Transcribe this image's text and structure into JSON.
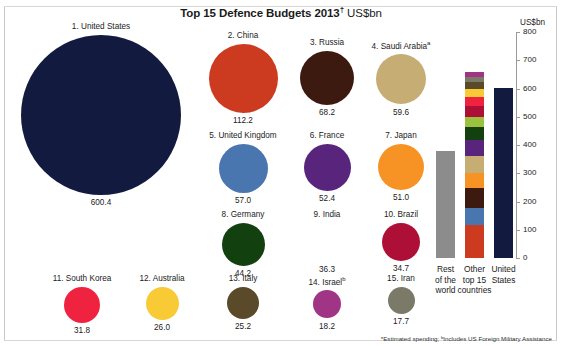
{
  "title": {
    "main": "Top 15 Defence Budgets 2013",
    "dagger": "†",
    "unit": "US$bn"
  },
  "axis": {
    "unit_label": "US$bn",
    "ticks": [
      "800",
      "700",
      "600",
      "500",
      "400",
      "300",
      "200",
      "100",
      "0"
    ]
  },
  "footnote": {
    "text": "*Estimated spending; ᵇIncludes US Foreign Military Assistance"
  },
  "bars": [
    {
      "key": "rest-of-world",
      "caption_lines": [
        "Rest",
        "of the",
        "world"
      ],
      "value": 380,
      "color": "#8c8c8c"
    },
    {
      "key": "other-top-15",
      "caption_lines": [
        "Other",
        "top 15",
        "countries"
      ],
      "value": 660,
      "color": "#d94d2a"
    },
    {
      "key": "united-states",
      "caption_lines": [
        "United",
        "States"
      ],
      "value": 600.4,
      "color": "#131a3f"
    }
  ],
  "chart_data": {
    "type": "bar",
    "title": "Top 15 Defence Budgets 2013† US$bn",
    "xlabel": "",
    "ylabel": "US$bn",
    "ylim": [
      0,
      800
    ],
    "grid": false,
    "legend": "none",
    "bubbles": {
      "note": "Area-proportional circles, one per country; value in US$bn",
      "categories": [
        "United States",
        "China",
        "Russia",
        "Saudi Arabia",
        "United Kingdom",
        "France",
        "Japan",
        "Germany",
        "India",
        "Brazil",
        "South Korea",
        "Australia",
        "Italy",
        "Israel",
        "Iran"
      ],
      "values": [
        600.4,
        112.2,
        68.2,
        59.6,
        57.0,
        52.4,
        51.0,
        44.2,
        36.3,
        34.7,
        31.8,
        26.0,
        25.2,
        18.2,
        17.7
      ]
    },
    "summary_bars": {
      "categories": [
        "Rest of the world",
        "Other top 15 countries",
        "United States"
      ],
      "values": [
        380,
        660,
        600.4
      ]
    },
    "stack_order_bottom_to_top": [
      "China",
      "United Kingdom",
      "Russia",
      "Japan",
      "Saudi Arabia",
      "France",
      "Germany",
      "India",
      "Brazil",
      "South Korea",
      "Australia",
      "Italy",
      "Iran",
      "Israel"
    ]
  },
  "countries": [
    {
      "rank": "1.",
      "name": "United States",
      "label": "1. United States",
      "value": "600.4",
      "n": 600.4,
      "color": "#131a3f",
      "sup": ""
    },
    {
      "rank": "2.",
      "name": "China",
      "label": "2. China",
      "value": "112.2",
      "n": 112.2,
      "color": "#cc3b20",
      "sup": ""
    },
    {
      "rank": "3.",
      "name": "Russia",
      "label": "3. Russia",
      "value": "68.2",
      "n": 68.2,
      "color": "#3d1a10",
      "sup": ""
    },
    {
      "rank": "4.",
      "name": "Saudi Arabia",
      "label": "4. Saudi Arabia",
      "value": "59.6",
      "n": 59.6,
      "color": "#c6ad74",
      "sup": "a"
    },
    {
      "rank": "5.",
      "name": "United Kingdom",
      "label": "5. United Kingdom",
      "value": "57.0",
      "n": 57.0,
      "color": "#4a76b0",
      "sup": ""
    },
    {
      "rank": "6.",
      "name": "France",
      "label": "6. France",
      "value": "52.4",
      "n": 52.4,
      "color": "#58247c",
      "sup": ""
    },
    {
      "rank": "7.",
      "name": "Japan",
      "label": "7. Japan",
      "value": "51.0",
      "n": 51.0,
      "color": "#f79324",
      "sup": ""
    },
    {
      "rank": "8.",
      "name": "Germany",
      "label": "8. Germany",
      "value": "44.2",
      "n": 44.2,
      "color": "#12400f",
      "sup": ""
    },
    {
      "rank": "9.",
      "name": "India",
      "label": "9. India",
      "value": "36.3",
      "n": 36.3,
      "color": "#9cc councils",
      "sup": ""
    },
    {
      "rank": "10.",
      "name": "Brazil",
      "label": "10. Brazil",
      "value": "34.7",
      "n": 34.7,
      "color": "#ad0f36",
      "sup": ""
    },
    {
      "rank": "11.",
      "name": "South Korea",
      "label": "11. South Korea",
      "value": "31.8",
      "n": 31.8,
      "color": "#ef2240",
      "sup": ""
    },
    {
      "rank": "12.",
      "name": "Australia",
      "label": "12. Australia",
      "value": "26.0",
      "n": 26.0,
      "color": "#f8ca36",
      "sup": ""
    },
    {
      "rank": "13.",
      "name": "Italy",
      "label": "13. Italy",
      "value": "25.2",
      "n": 25.2,
      "color": "#5b4a2a",
      "sup": ""
    },
    {
      "rank": "14.",
      "name": "Israel",
      "label": "14. Israel",
      "value": "18.2",
      "n": 18.2,
      "color": "#a13585",
      "sup": "b"
    },
    {
      "rank": "15.",
      "name": "Iran",
      "label": "15. Iran",
      "value": "17.7",
      "n": 17.7,
      "color": "#7b7a68",
      "sup": ""
    }
  ],
  "stack_segments": [
    {
      "name": "China",
      "value": 112.2,
      "color": "#cc3b20"
    },
    {
      "name": "United Kingdom",
      "value": 57.0,
      "color": "#4a76b0"
    },
    {
      "name": "Russia",
      "value": 68.2,
      "color": "#3d1a10"
    },
    {
      "name": "Japan",
      "value": 51.0,
      "color": "#f79324"
    },
    {
      "name": "Saudi Arabia",
      "value": 59.6,
      "color": "#c6ad74"
    },
    {
      "name": "France",
      "value": 52.4,
      "color": "#58247c"
    },
    {
      "name": "Germany",
      "value": 44.2,
      "color": "#12400f"
    },
    {
      "name": "India",
      "value": 36.3,
      "color": "#9cc13f"
    },
    {
      "name": "Brazil",
      "value": 34.7,
      "color": "#ad0f36"
    },
    {
      "name": "South Korea",
      "value": 31.8,
      "color": "#ef2240"
    },
    {
      "name": "Australia",
      "value": 26.0,
      "color": "#f8ca36"
    },
    {
      "name": "Italy",
      "value": 25.2,
      "color": "#5b4a2a"
    },
    {
      "name": "Iran",
      "value": 17.7,
      "color": "#7b7a68"
    },
    {
      "name": "Israel",
      "value": 18.2,
      "color": "#a13585"
    }
  ]
}
